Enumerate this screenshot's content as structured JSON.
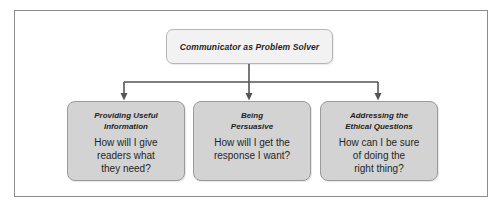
{
  "diagram": {
    "root": {
      "title": "Communicator as Problem Solver"
    },
    "children": [
      {
        "title_line1": "Providing Useful",
        "title_line2": "Information",
        "question_line1": "How will I give",
        "question_line2": "readers what",
        "question_line3": "they need?"
      },
      {
        "title_line1": "Being",
        "title_line2": "Persuasive",
        "question_line1": "How will I get the",
        "question_line2": "response I want?",
        "question_line3": ""
      },
      {
        "title_line1": "Addressing the",
        "title_line2": "Ethical Questions",
        "question_line1": "How can I be sure",
        "question_line2": "of doing the",
        "question_line3": "right thing?"
      }
    ],
    "colors": {
      "frame_border": "#8c8c8c",
      "root_fill": "#f2f2f2",
      "child_fill": "#d3d3d3",
      "box_border": "#9b9b9b",
      "connector": "#555555",
      "text": "#232323"
    }
  }
}
